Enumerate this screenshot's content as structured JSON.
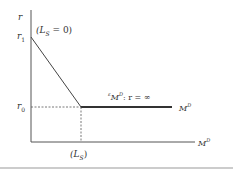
{
  "diagram": {
    "y_axis_label": "r",
    "x_axis_label": "M^D",
    "r1_label": "r",
    "r1_sub": "1",
    "r0_label": "r",
    "r0_sub": "0",
    "ls_zero_label": "(L_S = 0)",
    "ls_zero_pre": "(L",
    "ls_zero_sub": "S",
    "ls_zero_post": " = 0)",
    "ls_label_pre": "(L",
    "ls_label_sub": "S",
    "ls_label_post": ")",
    "elasticity_pre": "ε",
    "elasticity_m": "M",
    "elasticity_sup": "D",
    "elasticity_post": ": r = ∞",
    "demand_curve_label": "M",
    "demand_curve_sup": "D",
    "x_axis_m": "M",
    "x_axis_sup": "D"
  }
}
